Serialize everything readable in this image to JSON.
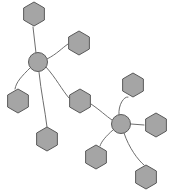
{
  "diagram": {
    "width": 169,
    "height": 195,
    "background": "#ffffff",
    "style": {
      "node_fill": "#a5a5a5",
      "node_stroke": "#5a5a5a",
      "node_stroke_width": 1,
      "edge_stroke": "#6e6e6e",
      "edge_stroke_width": 1
    },
    "nodes": [
      {
        "id": "hub-left",
        "label": "",
        "shape": "circle",
        "cx": 38,
        "cy": 62,
        "r": 9.5
      },
      {
        "id": "hub-right",
        "label": "",
        "shape": "circle",
        "cx": 121,
        "cy": 124,
        "r": 9.5
      },
      {
        "id": "hex-top",
        "label": "",
        "shape": "hexagon",
        "cx": 34,
        "cy": 14,
        "r": 12
      },
      {
        "id": "hex-upper-right",
        "label": "",
        "shape": "hexagon",
        "cx": 79,
        "cy": 43,
        "r": 12
      },
      {
        "id": "hex-left",
        "label": "",
        "shape": "hexagon",
        "cx": 18,
        "cy": 101,
        "r": 12
      },
      {
        "id": "hex-bottom-left",
        "label": "",
        "shape": "hexagon",
        "cx": 47,
        "cy": 139,
        "r": 12
      },
      {
        "id": "hex-bridge",
        "label": "",
        "shape": "hexagon",
        "cx": 80,
        "cy": 101,
        "r": 12
      },
      {
        "id": "hex-right-top",
        "label": "",
        "shape": "hexagon",
        "cx": 133,
        "cy": 85,
        "r": 12
      },
      {
        "id": "hex-far-right",
        "label": "",
        "shape": "hexagon",
        "cx": 156,
        "cy": 125,
        "r": 12
      },
      {
        "id": "hex-right-lower-left",
        "label": "",
        "shape": "hexagon",
        "cx": 96,
        "cy": 157,
        "r": 12
      },
      {
        "id": "hex-bottom-right",
        "label": "",
        "shape": "hexagon",
        "cx": 146,
        "cy": 177,
        "r": 12
      }
    ],
    "edges": [
      {
        "id": "edge-hubleft-hextop",
        "from": "hub-left",
        "to": "hex-top",
        "path": "M 36 53 L 33 27"
      },
      {
        "id": "edge-hubleft-hexupperright",
        "from": "hub-left",
        "to": "hex-upper-right",
        "path": "M 47 59 C 57 54 62 48 68 44"
      },
      {
        "id": "edge-hubleft-hexleft",
        "from": "hub-left",
        "to": "hex-left",
        "path": "M 30 68 C 22 76 16 82 15 89"
      },
      {
        "id": "edge-hubleft-hexbottomleft",
        "from": "hub-left",
        "to": "hex-bottom-left",
        "path": "M 39 72 C 41 92 45 110 47 127"
      },
      {
        "id": "edge-hubleft-hexbridge",
        "from": "hub-left",
        "to": "hex-bridge",
        "path": "M 46 67 C 56 78 62 90 69 98"
      },
      {
        "id": "edge-hexbridge-hubright",
        "from": "hex-bridge",
        "to": "hub-right",
        "path": "M 91 104 C 100 110 106 116 112 120"
      },
      {
        "id": "edge-hubright-hexrighttop",
        "from": "hub-right",
        "to": "hex-right-top",
        "path": "M 119 115 C 118 105 124 96 128 97"
      },
      {
        "id": "edge-hubright-hexfarright",
        "from": "hub-right",
        "to": "hex-far-right",
        "path": "M 131 124 L 144 125"
      },
      {
        "id": "edge-hubright-hexrightlowerleft",
        "from": "hub-right",
        "to": "hex-right-lower-left",
        "path": "M 113 130 C 106 136 101 142 100 146"
      },
      {
        "id": "edge-hubright-hexbottomright",
        "from": "hub-right",
        "to": "hex-bottom-right",
        "path": "M 124 133 C 129 148 138 160 144 165"
      }
    ]
  }
}
